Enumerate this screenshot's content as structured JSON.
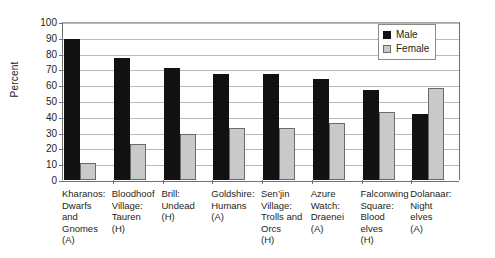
{
  "chart_data": {
    "type": "bar",
    "title": "",
    "xlabel": "",
    "ylabel": "Percent",
    "ylim": [
      0,
      100
    ],
    "ytick_step": 10,
    "yticks": [
      100,
      90,
      80,
      70,
      60,
      50,
      40,
      30,
      20,
      10,
      0
    ],
    "grid": true,
    "legend_position": "top-right",
    "categories": [
      "Kharanos:\nDwarfs\nand\nGnomes\n(A)",
      "Bloodhoof\nVillage:\nTauren\n(H)",
      "Brill:\nUndead\n(H)",
      "Goldshire:\nHumans\n(A)",
      "Sen’jin\nVillage:\nTrolls and\nOrcs\n(H)",
      "Azure\nWatch:\nDraenei\n(A)",
      "Falconwing\nSquare:\nBlood\nelves\n(H)",
      "Dolanaar:\nNight\nelves\n(A)"
    ],
    "series": [
      {
        "name": "Male",
        "color": "#111111",
        "values": [
          89,
          77,
          71,
          67,
          67,
          64,
          57,
          42
        ]
      },
      {
        "name": "Female",
        "color": "#c9c9c9",
        "values": [
          11,
          23,
          29,
          33,
          33,
          36,
          43,
          58
        ]
      }
    ]
  },
  "legend": {
    "items": [
      {
        "label": "Male"
      },
      {
        "label": "Female"
      }
    ]
  },
  "axis": {
    "y_title": "Percent"
  }
}
